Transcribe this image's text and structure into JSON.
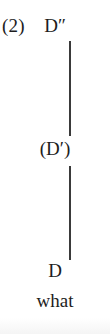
{
  "figure": {
    "example_number": "(2)",
    "type": "syntactic-tree",
    "orientation": "vertical",
    "nodes": [
      {
        "label": "D″",
        "position": "top"
      },
      {
        "label": "(D′)",
        "position": "middle"
      },
      {
        "label": "D",
        "position": "bottom"
      }
    ],
    "terminal": "what",
    "branches": [
      {
        "from": "D″",
        "to": "(D′)"
      },
      {
        "from": "(D′)",
        "to": "D"
      }
    ],
    "colors": {
      "background": "#ffffff",
      "text": "#1d1d1d",
      "branch": "#3a3a3a"
    }
  }
}
